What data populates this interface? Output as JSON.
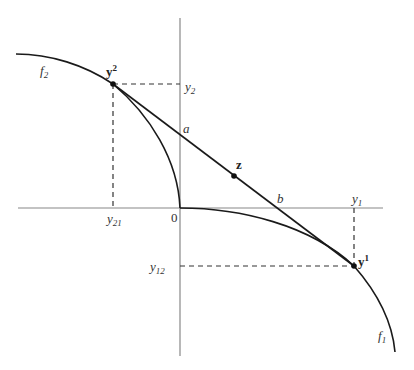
{
  "diagram": {
    "type": "pareto-front-illustration",
    "colors": {
      "axis": "#888888",
      "curve": "#1a1a1a",
      "dashed": "#333333",
      "text": "#333333"
    },
    "axes": {
      "origin_label": "0"
    },
    "curves": [
      {
        "id": "f2",
        "label_base": "f",
        "label_sub": "2"
      },
      {
        "id": "f1",
        "label_base": "f",
        "label_sub": "1"
      }
    ],
    "points": {
      "y2": {
        "label_base": "y",
        "label_sup": "2"
      },
      "y1": {
        "label_base": "y",
        "label_sup": "1"
      },
      "z": {
        "label": "z"
      }
    },
    "line_labels": {
      "a": "a",
      "b": "b"
    },
    "axis_ticks": {
      "y2_label_base": "y",
      "y2_label_sub": "2",
      "y21_label_base": "y",
      "y21_label_sub": "21",
      "y1_label_base": "y",
      "y1_label_sub": "1",
      "y12_label_base": "y",
      "y12_label_sub": "12"
    }
  }
}
